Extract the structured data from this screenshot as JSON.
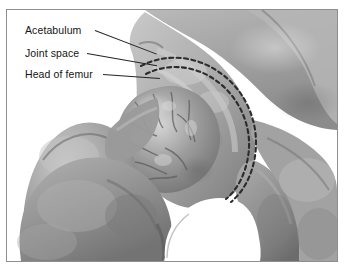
{
  "figure": {
    "kind": "anatomical-illustration",
    "view": "coronal anteroposterior",
    "border_color": "#8e8e8e",
    "background": "#ffffff"
  },
  "labels": [
    {
      "id": "acetabulum",
      "text": "Acetabulum",
      "x": 18,
      "y": 14,
      "leader_x1": 88,
      "leader_y1": 20,
      "leader_x2": 152,
      "leader_y2": 45
    },
    {
      "id": "joint-space",
      "text": "Joint space",
      "x": 18,
      "y": 37,
      "leader_x1": 80,
      "leader_y1": 43,
      "leader_x2": 150,
      "leader_y2": 55
    },
    {
      "id": "head-of-femur",
      "text": "Head of femur",
      "x": 18,
      "y": 58,
      "leader_x1": 96,
      "leader_y1": 64,
      "leader_x2": 152,
      "leader_y2": 68
    }
  ],
  "structures": [
    {
      "id": "ilium",
      "name": "Ilium",
      "tone": "#a9a9a9"
    },
    {
      "id": "acetabulum-cup",
      "name": "Acetabulum",
      "tone": "#b4b4b4"
    },
    {
      "id": "femoral-head",
      "name": "Head of femur",
      "tone": "#8d8d8d"
    },
    {
      "id": "greater-trochanter",
      "name": "Greater trochanter",
      "tone": "#a0a0a0"
    },
    {
      "id": "femoral-neck",
      "name": "Neck of femur",
      "tone": "#9b9b9b"
    },
    {
      "id": "pubis",
      "name": "Pubis",
      "tone": "#9e9e9e"
    },
    {
      "id": "ischium",
      "name": "Ischium",
      "tone": "#949494"
    },
    {
      "id": "obturator-foramen",
      "name": "Obturator foramen",
      "tone": "#ffffff"
    }
  ],
  "joint_space_marking": {
    "style": "double dashed arc",
    "dash_color": "#2b2b2b",
    "arc_count": 2
  },
  "palette": {
    "bone_light": "#cfcfcf",
    "bone_mid": "#a6a6a6",
    "bone_dark": "#6f6f6f",
    "bone_shadow": "#4e4e4e",
    "trabecular": "#7c7c7c",
    "highlight": "#e4e4e4",
    "outline": "#3a3a3a",
    "label_text": "#141414"
  }
}
